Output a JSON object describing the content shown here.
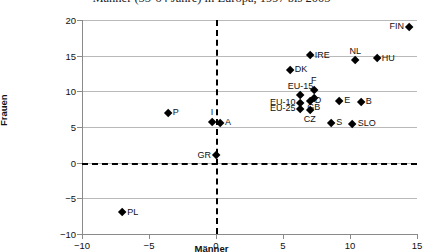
{
  "chart_data": {
    "type": "scatter",
    "title": "Männer (55-64 Jahre) in Europa, 1997 bis 2005",
    "xlabel": "Männer",
    "ylabel": "Frauen",
    "xlim": [
      -10,
      15
    ],
    "ylim": [
      -10,
      20
    ],
    "xticks": [
      -10,
      -5,
      0,
      5,
      10,
      15
    ],
    "yticks": [
      -10,
      -5,
      0,
      5,
      10,
      15,
      20
    ],
    "xtick_labels": [
      "-10",
      "-5",
      "0",
      "5",
      "10",
      "15"
    ],
    "ytick_labels": [
      "-10",
      "-5",
      "0",
      "5",
      "10",
      "15",
      "20"
    ],
    "grid": "horizontal",
    "reference_lines": [
      {
        "axis": "y",
        "value": 0,
        "style": "dashed"
      },
      {
        "axis": "x",
        "value": 0,
        "style": "dashed"
      }
    ],
    "legend": "none",
    "points": [
      {
        "label": "FIN",
        "x": 14.4,
        "y": 19.0,
        "pos": "l"
      },
      {
        "label": "IRE",
        "x": 7.0,
        "y": 15.0,
        "pos": "r"
      },
      {
        "label": "HU",
        "x": 12.0,
        "y": 14.6,
        "pos": "r"
      },
      {
        "label": "NL",
        "x": 10.4,
        "y": 14.3,
        "pos": "t"
      },
      {
        "label": "DK",
        "x": 5.5,
        "y": 13.0,
        "pos": "r"
      },
      {
        "label": "F",
        "x": 7.3,
        "y": 10.2,
        "pos": "t"
      },
      {
        "label": "EU-15",
        "x": 6.3,
        "y": 9.4,
        "pos": "t"
      },
      {
        "label": "GB",
        "x": 7.3,
        "y": 9.0,
        "pos": "b"
      },
      {
        "label": "D",
        "x": 7.0,
        "y": 8.6,
        "pos": "r"
      },
      {
        "label": "E",
        "x": 9.2,
        "y": 8.6,
        "pos": "r"
      },
      {
        "label": "B",
        "x": 10.8,
        "y": 8.5,
        "pos": "r"
      },
      {
        "label": "EU-10",
        "x": 6.3,
        "y": 8.4,
        "pos": "l"
      },
      {
        "label": "EU-25",
        "x": 6.3,
        "y": 7.5,
        "pos": "l"
      },
      {
        "label": "CZ",
        "x": 7.0,
        "y": 7.4,
        "pos": "b"
      },
      {
        "label": "P",
        "x": -3.6,
        "y": 7.0,
        "pos": "r"
      },
      {
        "label": "I",
        "x": -0.3,
        "y": 5.7,
        "pos": "t"
      },
      {
        "label": "A",
        "x": 0.3,
        "y": 5.6,
        "pos": "r"
      },
      {
        "label": "S",
        "x": 8.6,
        "y": 5.5,
        "pos": "r"
      },
      {
        "label": "SLO",
        "x": 10.2,
        "y": 5.4,
        "pos": "r"
      },
      {
        "label": "GR",
        "x": 0.0,
        "y": 1.0,
        "pos": "l"
      },
      {
        "label": "PL",
        "x": -7.0,
        "y": -7.0,
        "pos": "r"
      }
    ]
  }
}
